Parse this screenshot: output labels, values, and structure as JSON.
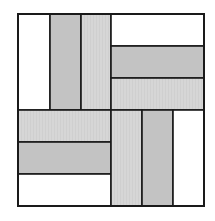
{
  "diagram": {
    "type": "quilt-block",
    "colors": {
      "white": "#ffffff",
      "dark_gray": "#c3c3c3",
      "light_gray": "#d6d6d6",
      "outline": "#1a1a1a"
    },
    "bounds": {
      "x": 18,
      "y": 14,
      "width": 186,
      "height": 192
    },
    "strips": [
      {
        "quadrant": "top-left",
        "x": 18,
        "y": 14,
        "w": 32,
        "h": 96,
        "fill": "white"
      },
      {
        "quadrant": "top-left",
        "x": 50,
        "y": 14,
        "w": 31,
        "h": 96,
        "fill": "dark_gray"
      },
      {
        "quadrant": "top-left",
        "x": 81,
        "y": 14,
        "w": 30,
        "h": 96,
        "fill": "light_gray"
      },
      {
        "quadrant": "top-right",
        "x": 111,
        "y": 14,
        "w": 93,
        "h": 32,
        "fill": "white"
      },
      {
        "quadrant": "top-right",
        "x": 111,
        "y": 46,
        "w": 93,
        "h": 32,
        "fill": "dark_gray"
      },
      {
        "quadrant": "top-right",
        "x": 111,
        "y": 78,
        "w": 93,
        "h": 32,
        "fill": "light_gray"
      },
      {
        "quadrant": "bottom-left",
        "x": 18,
        "y": 110,
        "w": 93,
        "h": 32,
        "fill": "light_gray"
      },
      {
        "quadrant": "bottom-left",
        "x": 18,
        "y": 142,
        "w": 93,
        "h": 32,
        "fill": "dark_gray"
      },
      {
        "quadrant": "bottom-left",
        "x": 18,
        "y": 174,
        "w": 93,
        "h": 32,
        "fill": "white"
      },
      {
        "quadrant": "bottom-right",
        "x": 111,
        "y": 110,
        "w": 31,
        "h": 96,
        "fill": "light_gray"
      },
      {
        "quadrant": "bottom-right",
        "x": 142,
        "y": 110,
        "w": 31,
        "h": 96,
        "fill": "dark_gray"
      },
      {
        "quadrant": "bottom-right",
        "x": 173,
        "y": 110,
        "w": 31,
        "h": 96,
        "fill": "white"
      }
    ]
  }
}
